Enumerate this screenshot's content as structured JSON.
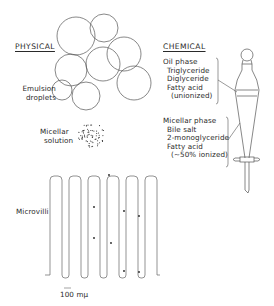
{
  "physical": {
    "heading": "PHYSICAL",
    "emulsion_label_line1": "Emulsion",
    "emulsion_label_line2": "droplets",
    "micellar_label_line1": "Micellar",
    "micellar_label_line2": "solution",
    "microvilli_label": "Microvilli",
    "scale_label": "100 mμ"
  },
  "chemical": {
    "heading": "CHEMICAL",
    "oil_phase": {
      "title": "Oil phase",
      "items": [
        "Triglyceride",
        "Diglyceride",
        "Fatty acid"
      ],
      "note": "(unionized)"
    },
    "micellar_phase": {
      "title": "Micellar phase",
      "items": [
        "Bile salt",
        "2-monoglyceride",
        "Fatty acid"
      ],
      "note": "(~50% ionized)"
    }
  },
  "colors": {
    "line": "#555555",
    "text": "#2a2a2a",
    "background": "#ffffff"
  }
}
